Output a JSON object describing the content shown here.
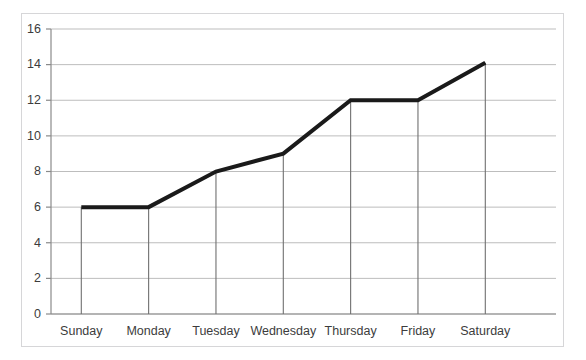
{
  "chart_data": {
    "type": "line",
    "title": "",
    "subtitle": "",
    "xlabel": "",
    "ylabel": "",
    "categories": [
      "Sunday",
      "Monday",
      "Tuesday",
      "Wednesday",
      "Thursday",
      "Friday",
      "Saturday"
    ],
    "values": [
      6,
      6,
      8,
      9,
      12,
      12,
      14.1
    ],
    "series": [
      {
        "name": "",
        "values": [
          6,
          6,
          8,
          9,
          12,
          12,
          14.1
        ]
      }
    ],
    "ylim": [
      0,
      16
    ],
    "ytick_labels": [
      "0",
      "2",
      "4",
      "6",
      "8",
      "10",
      "12",
      "14",
      "16"
    ],
    "ytick_values": [
      0,
      2,
      4,
      6,
      8,
      10,
      12,
      14,
      16
    ],
    "grid": "horizontal",
    "legend": "none",
    "drop_lines": true,
    "annotations": []
  },
  "style": {
    "line_color": "#1a1a1a",
    "line_width": 4,
    "grid_color": "#bdbdbd",
    "axis_color": "#8a8a8a",
    "drop_line_color": "#6f6f6f",
    "frame_color": "#d6d6d8",
    "text_color": "#3c3c3c",
    "background": "#ffffff"
  },
  "title_remnant": ""
}
